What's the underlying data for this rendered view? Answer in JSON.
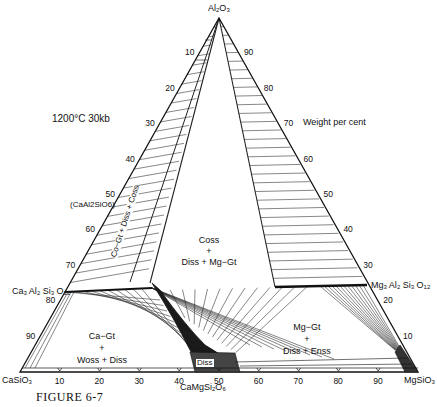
{
  "diagram": {
    "type": "ternary-phase-diagram",
    "conditions": "1200°C   30kb",
    "units": "Weight per cent",
    "caption": "FIGURE 6-7",
    "vertices": {
      "top": "Al2O3",
      "bottom_left": "CaSiO3",
      "bottom_right": "MgSiO3"
    },
    "compositions": {
      "ca_garnet": "Ca3Al2Si3O12",
      "mg_garnet": "Mg3Al2Si3O12",
      "ca_tschermak": "(CaAl2SiO6)",
      "diopside": "CaMgSi2O6"
    },
    "fields": {
      "ca_gt_wo_di": [
        "Ca−Gt",
        "+",
        "Woss + Diss"
      ],
      "mg_gt_di_en": [
        "Mg−Gt",
        "+",
        "Diss + Enss"
      ],
      "cs_di_mggt": [
        "Coss",
        "+",
        "Diss + Mg−Gt"
      ],
      "three_phase": "Co−Gt + Diss + Coss",
      "di_ss": "Diss"
    },
    "left_axis_ticks": [
      "10",
      "20",
      "30",
      "40",
      "50",
      "60",
      "70",
      "80",
      "90"
    ],
    "right_axis_ticks": [
      "90",
      "80",
      "70",
      "60",
      "50",
      "40",
      "30",
      "20",
      "10"
    ],
    "bottom_axis_ticks": [
      "10",
      "20",
      "30",
      "40",
      "50",
      "60",
      "70",
      "80",
      "90"
    ]
  }
}
